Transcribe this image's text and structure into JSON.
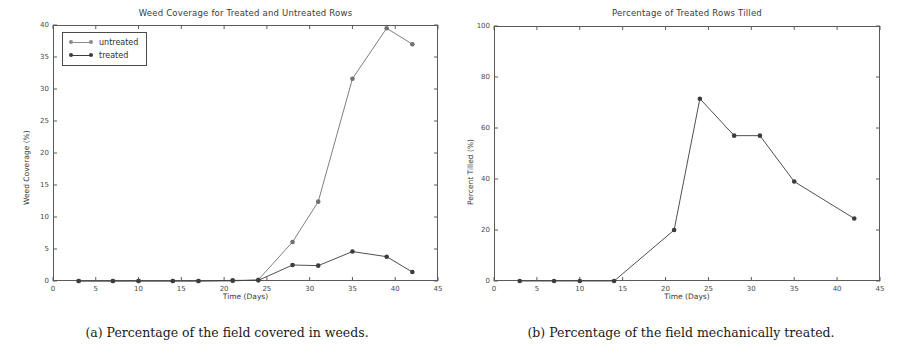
{
  "figure": {
    "panels": [
      {
        "caption": "(a) Percentage of the field covered in weeds.",
        "chart_data": {
          "type": "line",
          "title": "Weed Coverage for Treated and Untreated Rows",
          "xlabel": "Time (Days)",
          "ylabel": "Weed Coverage (%)",
          "xlim": [
            0,
            45
          ],
          "ylim": [
            0,
            40
          ],
          "xticks": [
            0,
            5,
            10,
            15,
            20,
            25,
            30,
            35,
            40,
            45
          ],
          "yticks": [
            0,
            5,
            10,
            15,
            20,
            25,
            30,
            35,
            40
          ],
          "grid": false,
          "legend_position": "upper left",
          "x": [
            3,
            7,
            10,
            14,
            17,
            21,
            24,
            28,
            31,
            35,
            39,
            42
          ],
          "series": [
            {
              "name": "untreated",
              "color": "#707070",
              "values": [
                0,
                0,
                0,
                0,
                0,
                0,
                0.2,
                6.1,
                12.4,
                31.6,
                39.5,
                37.0
              ]
            },
            {
              "name": "treated",
              "color": "#3c3c3c",
              "values": [
                0,
                0,
                0,
                0,
                0,
                0.1,
                0.1,
                2.5,
                2.4,
                4.6,
                3.8,
                1.4
              ]
            }
          ]
        }
      },
      {
        "caption": "(b) Percentage of the field mechanically treated.",
        "chart_data": {
          "type": "line",
          "title": "Percentage of Treated Rows Tilled",
          "xlabel": "Time (Days)",
          "ylabel": "Percent Tilled (%)",
          "xlim": [
            0,
            45
          ],
          "ylim": [
            0,
            100
          ],
          "xticks": [
            0,
            5,
            10,
            15,
            20,
            25,
            30,
            35,
            40,
            45
          ],
          "yticks": [
            0,
            20,
            40,
            60,
            80,
            100
          ],
          "grid": false,
          "legend_position": "none",
          "x": [
            3,
            7,
            10,
            14,
            21,
            24,
            28,
            31,
            35,
            42
          ],
          "series": [
            {
              "name": "tilled",
              "color": "#3c3c3c",
              "values": [
                0,
                0,
                0,
                0,
                20.0,
                71.5,
                57.0,
                57.0,
                39.0,
                24.5
              ]
            }
          ]
        }
      }
    ]
  }
}
